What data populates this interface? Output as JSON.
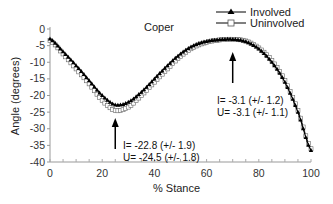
{
  "chart_data": {
    "type": "line",
    "title": "Coper",
    "xlabel": "% Stance",
    "ylabel": "Angle (degrees)",
    "xlim": [
      0,
      100
    ],
    "ylim": [
      -40,
      0
    ],
    "xticks": [
      0,
      20,
      40,
      60,
      80,
      100
    ],
    "yticks": [
      0,
      -5,
      -10,
      -15,
      -20,
      -25,
      -30,
      -35,
      -40
    ],
    "grid": false,
    "legend_position": "top-right",
    "x": [
      0,
      5,
      10,
      15,
      20,
      25,
      30,
      35,
      40,
      45,
      50,
      55,
      60,
      65,
      70,
      75,
      80,
      85,
      90,
      95,
      100
    ],
    "series": [
      {
        "name": "Involved",
        "marker": "filled-triangle",
        "values": [
          -3.0,
          -6.8,
          -11.0,
          -15.5,
          -20.0,
          -22.8,
          -22.0,
          -19.0,
          -15.0,
          -11.0,
          -7.5,
          -5.0,
          -3.7,
          -3.2,
          -3.1,
          -3.8,
          -6.0,
          -10.0,
          -16.0,
          -25.0,
          -36.5
        ]
      },
      {
        "name": "Uninvolved",
        "marker": "open-square",
        "values": [
          -3.5,
          -7.5,
          -12.0,
          -16.5,
          -21.5,
          -24.5,
          -23.5,
          -20.0,
          -16.0,
          -12.0,
          -8.2,
          -5.5,
          -4.0,
          -3.3,
          -3.1,
          -3.6,
          -5.7,
          -9.5,
          -15.5,
          -24.5,
          -36.0
        ]
      }
    ],
    "annotations": [
      {
        "x": 25,
        "lines": [
          "I= -22.8 (+/- 1.9)",
          "U= -24.5 (+/- 1.8)"
        ],
        "arrow": "up"
      },
      {
        "x": 70,
        "lines": [
          "I= -3.1 (+/- 1.2)",
          "U= -3.1 (+/- 1.1)"
        ],
        "arrow": "up"
      }
    ]
  },
  "labels": {
    "title": "Coper",
    "xlabel": "% Stance",
    "ylabel": "Angle (degrees)",
    "legend_involved": "Involved",
    "legend_uninvolved": "Uninvolved",
    "anno1_line1": "I= -22.8 (+/- 1.9)",
    "anno1_line2": "U= -24.5 (+/- 1.8)",
    "anno2_line1": "I= -3.1 (+/- 1.2)",
    "anno2_line2": "U= -3.1 (+/- 1.1)"
  }
}
